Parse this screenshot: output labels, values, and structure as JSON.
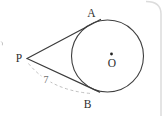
{
  "figure": {
    "type": "geometry-diagram",
    "labels": {
      "external_point": "P",
      "upper_tangent_point": "A",
      "lower_tangent_point": "B",
      "center": "O",
      "dashed_measure": "7"
    },
    "colors": {
      "line": "#3b3b3b",
      "dashed_line": "#b9b9b9",
      "label_text": "#2e2e2e",
      "measure_text": "#6f6f6f",
      "card_border": "#dcdcdc",
      "background": "#ffffff"
    }
  }
}
